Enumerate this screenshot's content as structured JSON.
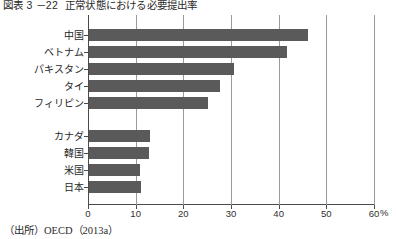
{
  "figure": {
    "number": "図表 3 －22",
    "title": "正常状態における必要提出率",
    "source": "（出所）OECD（2013a）"
  },
  "chart_data": {
    "type": "bar",
    "orientation": "horizontal",
    "title": "正常状態における必要提出率",
    "xlabel": "%",
    "ylabel": "",
    "xlim": [
      0,
      60
    ],
    "xticks": [
      0,
      10,
      20,
      30,
      40,
      50,
      60
    ],
    "xtick_labels": [
      "0",
      "10",
      "20",
      "30",
      "40",
      "50",
      "60"
    ],
    "unit": "%",
    "grid": true,
    "legend": false,
    "bar_color": "#5a5a5a",
    "groups": [
      {
        "name": "group-upper",
        "categories": [
          "中国",
          "ベトナム",
          "パキスタン",
          "タイ",
          "フィリピン"
        ],
        "values": [
          46,
          41.5,
          30.5,
          27.5,
          25
        ]
      },
      {
        "name": "group-lower",
        "categories": [
          "カナダ",
          "韓国",
          "米国",
          "日本"
        ],
        "values": [
          12.8,
          12.5,
          10.7,
          10.9
        ]
      }
    ],
    "categories": [
      "中国",
      "ベトナム",
      "パキスタン",
      "タイ",
      "フィリピン",
      "カナダ",
      "韓国",
      "米国",
      "日本"
    ],
    "values": [
      46,
      41.5,
      30.5,
      27.5,
      25,
      12.8,
      12.5,
      10.7,
      10.9
    ]
  }
}
